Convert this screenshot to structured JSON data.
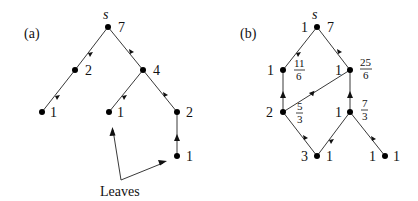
{
  "panel_a": {
    "label": "(a)",
    "source_label": "s",
    "nodes": [
      {
        "id": "s",
        "value": "7"
      },
      {
        "id": "a1",
        "value": "2"
      },
      {
        "id": "a2",
        "value": "4"
      },
      {
        "id": "a3",
        "value": "1"
      },
      {
        "id": "a4",
        "value": "1"
      },
      {
        "id": "a5",
        "value": "2"
      },
      {
        "id": "a6",
        "value": "1"
      }
    ],
    "annotation": "Leaves"
  },
  "panel_b": {
    "label": "(b)",
    "source_label": "s",
    "nodes": [
      {
        "id": "s",
        "left": "1",
        "right": "7"
      },
      {
        "id": "b1",
        "left": "1",
        "num": "11",
        "den": "6"
      },
      {
        "id": "b2",
        "left": "1",
        "num": "25",
        "den": "6"
      },
      {
        "id": "b3",
        "left": "2",
        "num": "5",
        "den": "3"
      },
      {
        "id": "b4",
        "left": "1",
        "num": "7",
        "den": "3"
      },
      {
        "id": "b5",
        "left": "3",
        "right": "1"
      },
      {
        "id": "b6",
        "left": "1",
        "right": "1"
      }
    ]
  }
}
